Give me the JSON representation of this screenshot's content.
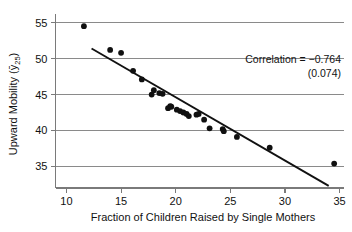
{
  "chart_data": {
    "type": "scatter",
    "title": "",
    "xlabel": "Fraction of Children Raised by Single Mothers",
    "ylabel": "Upward Mobility (ȳ₂₅)",
    "ylabel_main": "Upward Mobility (",
    "ylabel_symbol": "ȳ",
    "ylabel_subscript": "25",
    "ylabel_close": ")",
    "xlim": [
      9.0,
      35.4
    ],
    "ylim": [
      32.0,
      56.2
    ],
    "xticks": [
      10,
      15,
      20,
      25,
      30,
      35
    ],
    "xticklabels": [
      "10",
      "15",
      "20",
      "25",
      "30",
      "35"
    ],
    "yticks": [
      35,
      40,
      45,
      50,
      55
    ],
    "yticklabels": [
      "35",
      "40",
      "45",
      "50",
      "55"
    ],
    "grid": "horizontal",
    "legend": "none",
    "x": [
      11.6,
      14.0,
      15.0,
      16.1,
      16.9,
      17.8,
      18.0,
      18.5,
      18.8,
      19.3,
      19.5,
      19.6,
      20.1,
      20.4,
      20.7,
      21.0,
      21.2,
      21.9,
      22.1,
      22.6,
      23.1,
      24.3,
      24.4,
      25.6,
      28.6,
      34.5
    ],
    "y": [
      54.5,
      51.2,
      50.8,
      48.3,
      47.1,
      45.0,
      45.6,
      45.2,
      45.1,
      43.1,
      43.4,
      43.3,
      42.9,
      42.7,
      42.5,
      42.3,
      42.0,
      42.2,
      42.3,
      41.5,
      40.3,
      40.2,
      39.9,
      39.1,
      37.6,
      35.4
    ],
    "points": [
      {
        "x": 11.6,
        "y": 54.5
      },
      {
        "x": 14.0,
        "y": 51.2
      },
      {
        "x": 15.0,
        "y": 50.8
      },
      {
        "x": 16.1,
        "y": 48.3
      },
      {
        "x": 16.9,
        "y": 47.1
      },
      {
        "x": 17.8,
        "y": 45.0
      },
      {
        "x": 18.0,
        "y": 45.6
      },
      {
        "x": 18.5,
        "y": 45.2
      },
      {
        "x": 18.8,
        "y": 45.1
      },
      {
        "x": 19.3,
        "y": 43.1
      },
      {
        "x": 19.5,
        "y": 43.4
      },
      {
        "x": 19.6,
        "y": 43.3
      },
      {
        "x": 20.1,
        "y": 42.9
      },
      {
        "x": 20.4,
        "y": 42.7
      },
      {
        "x": 20.7,
        "y": 42.5
      },
      {
        "x": 21.0,
        "y": 42.3
      },
      {
        "x": 21.2,
        "y": 42.0
      },
      {
        "x": 21.9,
        "y": 42.2
      },
      {
        "x": 22.1,
        "y": 42.3
      },
      {
        "x": 22.6,
        "y": 41.5
      },
      {
        "x": 23.1,
        "y": 40.3
      },
      {
        "x": 24.3,
        "y": 40.2
      },
      {
        "x": 24.4,
        "y": 39.9
      },
      {
        "x": 25.6,
        "y": 39.1
      },
      {
        "x": 28.6,
        "y": 37.6
      },
      {
        "x": 34.5,
        "y": 35.4
      }
    ],
    "fit_line": {
      "x_start": 12.3,
      "y_start": 51.4,
      "x_end": 34.0,
      "y_end": 32.3
    },
    "annotations": {
      "correlation_line": "Correlation = −0.764",
      "standard_error_line": "(0.074)",
      "correlation_value": "-0.764",
      "standard_error_value": "0.074"
    },
    "colors": {
      "point": "#101010",
      "fit_line": "#111111",
      "grid": "#8a8a8a",
      "axis": "#7a7a7a",
      "background": "#ffffff",
      "text": "#111111"
    }
  }
}
